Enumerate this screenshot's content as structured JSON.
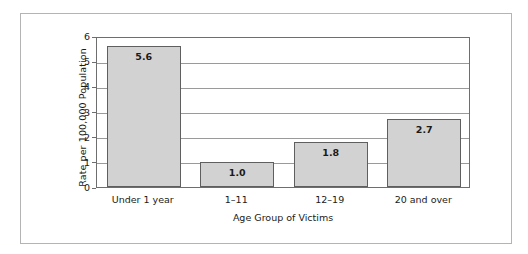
{
  "chart_data": {
    "type": "bar",
    "title": "",
    "subtitle": "",
    "xlabel": "Age Group of Victims",
    "ylabel": "Rate per 100,000 Population",
    "categories": [
      "Under 1 year",
      "1–11",
      "12–19",
      "20 and over"
    ],
    "values": [
      5.6,
      1.0,
      1.8,
      2.7
    ],
    "data_labels": [
      "5.6",
      "1.0",
      "1.8",
      "2.7"
    ],
    "ylim": [
      0,
      6
    ],
    "yticks": [
      0,
      1,
      2,
      3,
      4,
      5,
      6
    ],
    "ytick_labels": [
      "0",
      "1",
      "2",
      "3",
      "4",
      "5",
      "6"
    ],
    "grid": true,
    "grid_axis": "y",
    "legend": false,
    "legend_position": "none",
    "bar_fill_color": "#d2d2d2",
    "bar_edge_color": "#5f5f5f",
    "gridline_color": "#9a9a9a",
    "axis_color": "#6e6e6e",
    "frame_color": "#b4b4b4",
    "text_color": "#1a1a1a",
    "background_color": "#ffffff"
  }
}
